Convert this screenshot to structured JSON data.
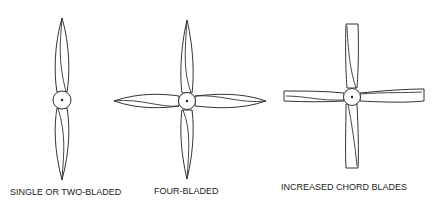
{
  "diagram": {
    "figures": [
      {
        "id": "two-blade",
        "label": "SINGLE OR TWO-BLADED",
        "blades": 2,
        "blade_shape": "narrow-tapered"
      },
      {
        "id": "four-blade",
        "label": "FOUR-BLADED",
        "blades": 4,
        "blade_shape": "narrow-tapered"
      },
      {
        "id": "chord-blade",
        "label": "INCREASED CHORD BLADES",
        "blades": 4,
        "blade_shape": "wide-squared-tip"
      }
    ],
    "colors": {
      "line": "#333333",
      "background": "#ffffff",
      "text": "#222222"
    }
  }
}
